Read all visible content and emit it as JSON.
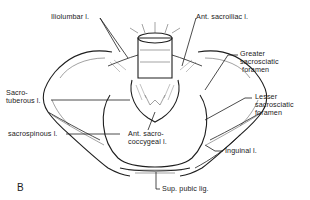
{
  "figure": {
    "panel_label": "B",
    "labels": [
      {
        "id": "iliolumbar",
        "text": "Iliolumbar l."
      },
      {
        "id": "ant-sacroiliac",
        "text": "Ant. sacroiliac l."
      },
      {
        "id": "greater-foramen",
        "text": "Greater\nsacrosciatic\n foramen"
      },
      {
        "id": "sacrotuberous",
        "text": "Sacro-\ntuberous l."
      },
      {
        "id": "lesser-foramen",
        "text": "Lesser\nsacrosciatic\nforamen"
      },
      {
        "id": "sacrospinous",
        "text": "sacrospinous l."
      },
      {
        "id": "ant-sacrococcygeal",
        "text": "Ant. sacro-\ncoccygeal l."
      },
      {
        "id": "inguinal",
        "text": "Inguinal l."
      },
      {
        "id": "sup-pubic",
        "text": "Sup. pubic lig."
      }
    ]
  }
}
